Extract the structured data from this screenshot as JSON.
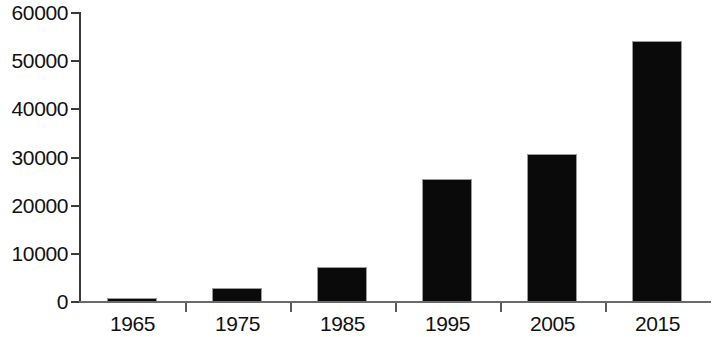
{
  "chart_data": {
    "type": "bar",
    "title": "",
    "subtitle": "",
    "xlabel": "",
    "ylabel": "",
    "categories": [
      "1965",
      "1975",
      "1985",
      "1995",
      "2005",
      "2015"
    ],
    "values": [
      600,
      2800,
      7000,
      25300,
      30600,
      54000
    ],
    "series": [
      {
        "name": "",
        "values": [
          600,
          2800,
          7000,
          25300,
          30600,
          54000
        ]
      }
    ],
    "ylim": [
      0,
      60000
    ],
    "ytick_labels": [
      "0",
      "10000",
      "20000",
      "30000",
      "40000",
      "50000",
      "60000"
    ],
    "ytick_values": [
      0,
      10000,
      20000,
      30000,
      40000,
      50000,
      60000
    ],
    "xtick_labels": [
      "1965",
      "1975",
      "1985",
      "1995",
      "2005",
      "2015"
    ],
    "grid": false,
    "legend": false,
    "legend_position": "none",
    "bar_color": "#0a0a0a",
    "axis_color": "#3a3a3a",
    "background_color": "#ffffff"
  },
  "axes": {
    "y": {
      "ticks": [
        {
          "label": "60000",
          "value": 60000
        },
        {
          "label": "50000",
          "value": 50000
        },
        {
          "label": "40000",
          "value": 40000
        },
        {
          "label": "30000",
          "value": 30000
        },
        {
          "label": "20000",
          "value": 20000
        },
        {
          "label": "10000",
          "value": 10000
        },
        {
          "label": "0",
          "value": 0
        }
      ]
    },
    "x": {
      "ticks": [
        {
          "label": "1965"
        },
        {
          "label": "1975"
        },
        {
          "label": "1985"
        },
        {
          "label": "1995"
        },
        {
          "label": "2005"
        },
        {
          "label": "2015"
        }
      ]
    }
  }
}
